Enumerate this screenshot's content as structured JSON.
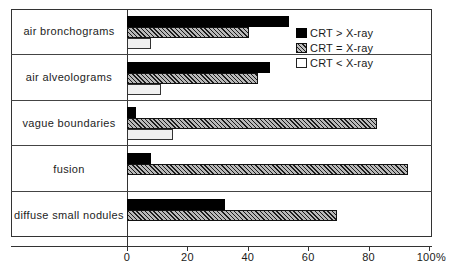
{
  "chart_data": {
    "type": "bar",
    "orientation": "horizontal",
    "title": "",
    "xlabel": "",
    "ylabel": "",
    "xlim": [
      0,
      100
    ],
    "grid": false,
    "legend_position": "inside-top-right",
    "axis_unit_suffix": "%",
    "categories": [
      "air bronchograms",
      "air alveolograms",
      "vague boundaries",
      "fusion",
      "diffuse small nodules"
    ],
    "xticks": [
      0,
      20,
      40,
      60,
      80,
      100
    ],
    "xtick_labels": [
      "0",
      "20",
      "40",
      "60",
      "80",
      "100%"
    ],
    "series": [
      {
        "name": "CRT > X-ray",
        "key": "gt",
        "fill": "solid-black",
        "color": "#000000",
        "values": [
          53,
          47,
          3,
          8,
          32
        ]
      },
      {
        "name": "CRT = X-ray",
        "key": "eq",
        "fill": "diagonal-hatch",
        "color": "#b9b9b9",
        "values": [
          40,
          43,
          82,
          92,
          69
        ]
      },
      {
        "name": "CRT < X-ray",
        "key": "lt",
        "fill": "white-outline",
        "color": "#ffffff",
        "values": [
          8,
          11,
          15,
          0,
          0
        ]
      }
    ]
  },
  "legend": {
    "items": [
      {
        "label": "CRT > X-ray",
        "swatch": "solid-black-swatch"
      },
      {
        "label": "CRT = X-ray",
        "swatch": "hatched-swatch"
      },
      {
        "label": "CRT < X-ray",
        "swatch": "white-swatch"
      }
    ]
  }
}
